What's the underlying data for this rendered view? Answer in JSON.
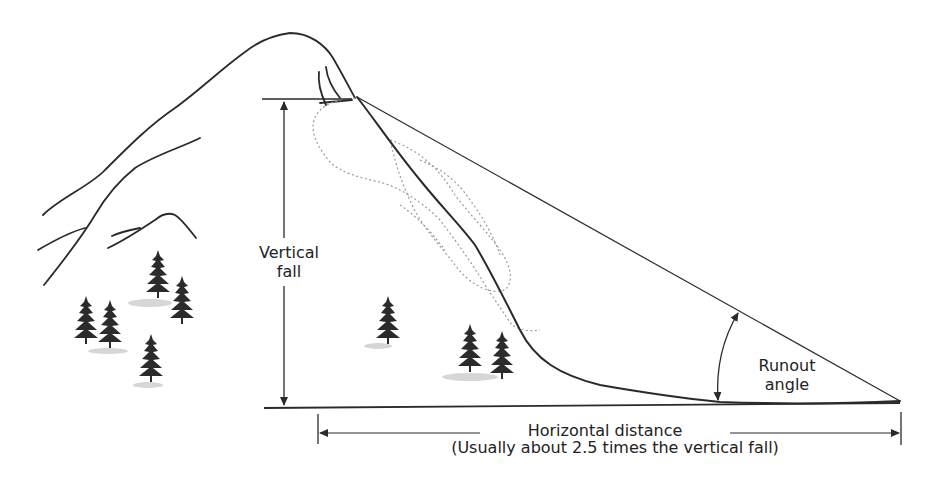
{
  "diagram": {
    "labels": {
      "vertical_fall_line1": "Vertical",
      "vertical_fall_line2": "fall",
      "runout_angle_line1": "Runout",
      "runout_angle_line2": "angle",
      "horizontal_distance": "Horizontal distance",
      "horizontal_distance_note": "(Usually about 2.5 times the vertical fall)"
    },
    "colors": {
      "line": "#2a2a2a",
      "debris": "#9a9a9a",
      "tree": "#2b2b2b",
      "shadow": "#cfcfcf",
      "background": "#ffffff"
    },
    "elements": {
      "mountain": "mountain-ridge",
      "avalanche_path": "slide-path",
      "trees": "conifer-trees",
      "runout_line": "sight-line-from-start-zone-to-toe"
    }
  }
}
